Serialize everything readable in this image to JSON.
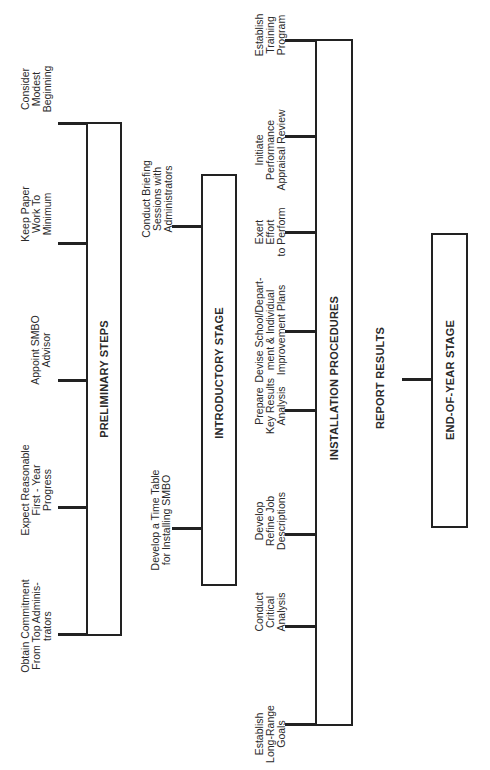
{
  "stages": {
    "preliminary": {
      "title": "PRELIMINARY STEPS",
      "items": [
        "Consider\nModest\nBeginning",
        "Keep Paper\nWork To\nMinimum",
        "Appoint SMBO\nAdvisor",
        "Expect Reasonable\nFirst - Year\nProgress",
        "Obtain Commitment\nFrom Top Adminis-\ntrators"
      ]
    },
    "introductory": {
      "title": "INTRODUCTORY STAGE",
      "items": [
        "Conduct Briefing\nSessions with\nAdministrators",
        "Develop a Time Table\nfor Installing SMBO"
      ]
    },
    "installation": {
      "title": "INSTALLATION PROCEDURES",
      "items": [
        "Establish\nTraining\nProgram",
        "Initiate\nPerformance\nAppraisal Review",
        "Exert\nEffort\nto Perform",
        "Devise School/Depart-\nment & Individual\nImprovement Plans",
        "Prepare\nKey Results\nAnalysis",
        "Develop\nRefine Job\nDescriptions",
        "Conduct\nCritical\nAnalysis",
        "Establish\nLong-Range\nGoals"
      ]
    },
    "end_of_year": {
      "title": "END-OF-YEAR STAGE",
      "items": [
        "REPORT RESULTS"
      ]
    }
  }
}
